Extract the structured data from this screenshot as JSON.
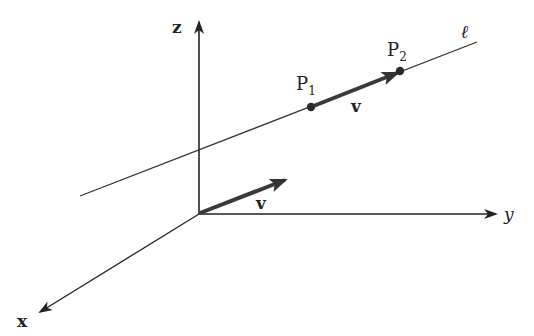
{
  "diagram": {
    "colors": {
      "axis": "#222222",
      "line": "#333333",
      "vector": "#3a3a3a",
      "point": "#2a2a2a"
    },
    "axes": {
      "x_label": "x",
      "y_label": "y",
      "z_label": "z"
    },
    "line_label": "ℓ",
    "points": [
      {
        "name": "P",
        "sub": "1"
      },
      {
        "name": "P",
        "sub": "2"
      }
    ],
    "vectors": [
      {
        "label": "v",
        "location": "on line from P1 to P2"
      },
      {
        "label": "v",
        "location": "from origin"
      }
    ]
  }
}
